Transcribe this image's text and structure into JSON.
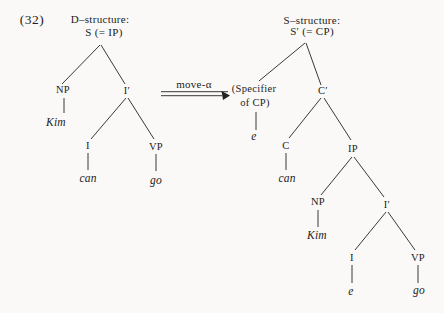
{
  "figure": {
    "number": "(32)"
  },
  "arrow": {
    "label": "move-α"
  },
  "colors": {
    "ink": "#1c1c1c",
    "paper": "#faf9f7"
  },
  "d_structure": {
    "title": "D–structure:",
    "root": "S (= IP)",
    "np": "NP",
    "np_word": "Kim",
    "i_bar": "I′",
    "i": "I",
    "i_word": "can",
    "vp": "VP",
    "vp_word": "go"
  },
  "s_structure": {
    "title": "S–structure:",
    "root": "S′ (= CP)",
    "specifier_line1": "(Specifier",
    "specifier_line2": "of CP)",
    "specifier_word": "e",
    "c_bar": "C′",
    "c": "C",
    "c_word": "can",
    "ip": "IP",
    "np": "NP",
    "np_word": "Kim",
    "i_bar": "I′",
    "i": "I",
    "i_word": "e",
    "vp": "VP",
    "vp_word": "go"
  }
}
